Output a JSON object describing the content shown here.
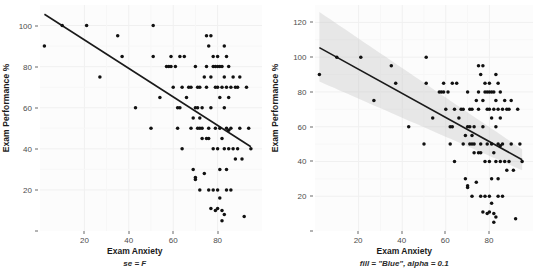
{
  "figure": {
    "width": 539,
    "height": 275,
    "background": "#ffffff",
    "panel_background": "#fcfcfc",
    "grid_color": "#f0f0f0",
    "point_color": "#111111",
    "line_color": "#1a1a1a",
    "ribbon_color": "#bfbfbf",
    "ribbon_alpha": 0.35
  },
  "chart_data": [
    {
      "type": "scatter",
      "id": "left-panel",
      "title": "",
      "caption": "se = F",
      "xlabel": "Exam Anxiety",
      "ylabel": "Exam Performance %",
      "xticks": [
        20,
        40,
        60,
        80
      ],
      "yticks": [
        20,
        40,
        60,
        80,
        100
      ],
      "xlim": [
        0,
        100
      ],
      "ylim": [
        0,
        110
      ],
      "grid": true,
      "legend": "none",
      "fit": {
        "type": "linear",
        "show_se": false,
        "x": [
          2,
          95
        ],
        "y": [
          105.5,
          41.0
        ],
        "color": "#1a1a1a"
      },
      "points": [
        [
          2,
          90
        ],
        [
          10,
          100
        ],
        [
          21,
          100
        ],
        [
          27,
          75
        ],
        [
          35,
          95
        ],
        [
          37,
          85
        ],
        [
          43,
          60
        ],
        [
          50,
          50
        ],
        [
          51,
          100
        ],
        [
          51,
          85
        ],
        [
          54,
          65
        ],
        [
          57,
          80
        ],
        [
          58,
          80
        ],
        [
          59,
          80
        ],
        [
          59,
          85
        ],
        [
          60,
          70
        ],
        [
          61,
          80
        ],
        [
          62,
          60
        ],
        [
          62,
          50
        ],
        [
          63,
          85
        ],
        [
          63,
          60
        ],
        [
          64,
          70
        ],
        [
          64,
          40
        ],
        [
          65,
          85
        ],
        [
          66,
          65
        ],
        [
          67,
          70
        ],
        [
          68,
          70
        ],
        [
          68,
          50
        ],
        [
          69,
          55
        ],
        [
          69,
          30
        ],
        [
          70,
          26
        ],
        [
          70,
          25
        ],
        [
          70,
          60
        ],
        [
          70,
          80
        ],
        [
          71,
          50
        ],
        [
          71,
          70
        ],
        [
          71,
          60
        ],
        [
          72,
          70
        ],
        [
          72,
          50
        ],
        [
          72,
          55
        ],
        [
          72,
          20
        ],
        [
          73,
          50
        ],
        [
          73,
          45
        ],
        [
          73,
          60
        ],
        [
          74,
          28
        ],
        [
          74,
          75
        ],
        [
          75,
          95
        ],
        [
          75,
          80
        ],
        [
          75,
          70
        ],
        [
          75,
          45
        ],
        [
          76,
          45
        ],
        [
          76,
          90
        ],
        [
          76,
          50
        ],
        [
          76,
          20
        ],
        [
          77,
          95
        ],
        [
          77,
          75
        ],
        [
          77,
          60
        ],
        [
          77,
          11
        ],
        [
          78,
          85
        ],
        [
          78,
          80
        ],
        [
          78,
          40
        ],
        [
          78,
          20
        ],
        [
          79,
          80
        ],
        [
          79,
          70
        ],
        [
          79,
          50
        ],
        [
          79,
          10
        ],
        [
          80,
          85
        ],
        [
          80,
          80
        ],
        [
          80,
          70
        ],
        [
          80,
          40
        ],
        [
          80,
          20
        ],
        [
          80,
          11
        ],
        [
          81,
          80
        ],
        [
          81,
          65
        ],
        [
          81,
          50
        ],
        [
          81,
          30
        ],
        [
          81,
          16
        ],
        [
          82,
          80
        ],
        [
          82,
          70
        ],
        [
          82,
          45
        ],
        [
          82,
          10
        ],
        [
          82,
          5
        ],
        [
          83,
          90
        ],
        [
          83,
          75
        ],
        [
          83,
          60
        ],
        [
          83,
          40
        ],
        [
          83,
          8
        ],
        [
          84,
          85
        ],
        [
          84,
          70
        ],
        [
          84,
          50
        ],
        [
          84,
          30
        ],
        [
          84,
          20
        ],
        [
          85,
          80
        ],
        [
          85,
          65
        ],
        [
          85,
          49
        ],
        [
          85,
          40
        ],
        [
          86,
          70
        ],
        [
          86,
          50
        ],
        [
          86,
          20
        ],
        [
          87,
          75
        ],
        [
          87,
          40
        ],
        [
          88,
          70
        ],
        [
          88,
          35
        ],
        [
          89,
          70
        ],
        [
          89,
          40
        ],
        [
          90,
          75
        ],
        [
          90,
          50
        ],
        [
          91,
          35
        ],
        [
          92,
          7
        ],
        [
          93,
          70
        ],
        [
          94,
          50
        ],
        [
          95,
          40
        ]
      ]
    },
    {
      "type": "scatter",
      "id": "right-panel",
      "title": "",
      "caption": "fill = \"Blue\", alpha = 0.1",
      "xlabel": "Exam Anxiety",
      "ylabel": "Exam Performance %",
      "xticks": [
        20,
        40,
        60,
        80
      ],
      "yticks": [
        20,
        40,
        60,
        80,
        100,
        120
      ],
      "xlim": [
        0,
        100
      ],
      "ylim": [
        0,
        130
      ],
      "grid": true,
      "legend": "none",
      "fit": {
        "type": "linear",
        "show_se": true,
        "se_fill": "Blue",
        "se_alpha": 0.1,
        "x": [
          2,
          95
        ],
        "y": [
          105.5,
          41.0
        ],
        "color": "#1a1a1a",
        "ribbon_upper": [
          126,
          47
        ],
        "ribbon_lower": [
          86,
          35
        ]
      },
      "points": [
        [
          2,
          90
        ],
        [
          10,
          100
        ],
        [
          21,
          100
        ],
        [
          27,
          75
        ],
        [
          35,
          95
        ],
        [
          37,
          85
        ],
        [
          43,
          60
        ],
        [
          50,
          50
        ],
        [
          51,
          100
        ],
        [
          51,
          85
        ],
        [
          54,
          65
        ],
        [
          57,
          80
        ],
        [
          58,
          80
        ],
        [
          59,
          80
        ],
        [
          59,
          85
        ],
        [
          60,
          70
        ],
        [
          61,
          80
        ],
        [
          62,
          60
        ],
        [
          62,
          50
        ],
        [
          63,
          85
        ],
        [
          63,
          60
        ],
        [
          64,
          70
        ],
        [
          64,
          40
        ],
        [
          65,
          85
        ],
        [
          66,
          65
        ],
        [
          67,
          70
        ],
        [
          68,
          70
        ],
        [
          68,
          50
        ],
        [
          69,
          55
        ],
        [
          69,
          30
        ],
        [
          70,
          26
        ],
        [
          70,
          25
        ],
        [
          70,
          60
        ],
        [
          70,
          80
        ],
        [
          71,
          50
        ],
        [
          71,
          70
        ],
        [
          71,
          60
        ],
        [
          72,
          70
        ],
        [
          72,
          50
        ],
        [
          72,
          55
        ],
        [
          72,
          20
        ],
        [
          73,
          50
        ],
        [
          73,
          45
        ],
        [
          73,
          60
        ],
        [
          74,
          28
        ],
        [
          74,
          75
        ],
        [
          75,
          95
        ],
        [
          75,
          80
        ],
        [
          75,
          70
        ],
        [
          75,
          45
        ],
        [
          76,
          45
        ],
        [
          76,
          90
        ],
        [
          76,
          50
        ],
        [
          76,
          20
        ],
        [
          77,
          95
        ],
        [
          77,
          75
        ],
        [
          77,
          60
        ],
        [
          77,
          11
        ],
        [
          78,
          85
        ],
        [
          78,
          80
        ],
        [
          78,
          40
        ],
        [
          78,
          20
        ],
        [
          79,
          80
        ],
        [
          79,
          70
        ],
        [
          79,
          50
        ],
        [
          79,
          10
        ],
        [
          80,
          85
        ],
        [
          80,
          80
        ],
        [
          80,
          70
        ],
        [
          80,
          40
        ],
        [
          80,
          20
        ],
        [
          80,
          11
        ],
        [
          81,
          80
        ],
        [
          81,
          65
        ],
        [
          81,
          50
        ],
        [
          81,
          30
        ],
        [
          81,
          16
        ],
        [
          82,
          80
        ],
        [
          82,
          70
        ],
        [
          82,
          45
        ],
        [
          82,
          10
        ],
        [
          82,
          5
        ],
        [
          83,
          90
        ],
        [
          83,
          75
        ],
        [
          83,
          60
        ],
        [
          83,
          40
        ],
        [
          83,
          8
        ],
        [
          84,
          85
        ],
        [
          84,
          70
        ],
        [
          84,
          50
        ],
        [
          84,
          30
        ],
        [
          84,
          20
        ],
        [
          85,
          80
        ],
        [
          85,
          65
        ],
        [
          85,
          49
        ],
        [
          85,
          40
        ],
        [
          86,
          70
        ],
        [
          86,
          50
        ],
        [
          86,
          20
        ],
        [
          87,
          75
        ],
        [
          87,
          40
        ],
        [
          88,
          70
        ],
        [
          88,
          35
        ],
        [
          89,
          70
        ],
        [
          89,
          40
        ],
        [
          90,
          75
        ],
        [
          90,
          50
        ],
        [
          91,
          35
        ],
        [
          92,
          7
        ],
        [
          93,
          70
        ],
        [
          94,
          50
        ],
        [
          95,
          40
        ]
      ]
    }
  ]
}
